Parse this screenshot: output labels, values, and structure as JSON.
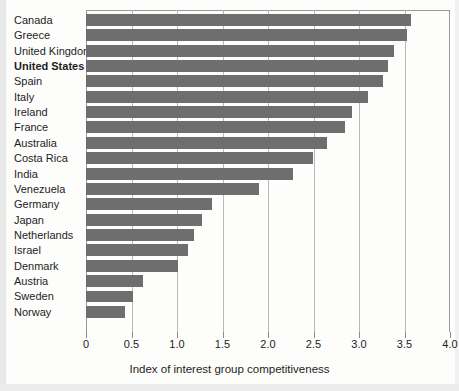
{
  "chart_data": {
    "type": "bar",
    "orientation": "horizontal",
    "title": "",
    "xlabel": "Index of interest group competitiveness",
    "ylabel": "",
    "xlim": [
      0,
      4.0
    ],
    "xticks": [
      "0",
      "0.5",
      "1.0",
      "1.5",
      "2.0",
      "2.5",
      "3.0",
      "3.5",
      "4.0"
    ],
    "xtick_values": [
      0,
      0.5,
      1.0,
      1.5,
      2.0,
      2.5,
      3.0,
      3.5,
      4.0
    ],
    "grid": true,
    "grid_axis": "x",
    "legend": "none",
    "bar_color": "#6e6e6e",
    "highlight_category": "United States",
    "categories": [
      "Canada",
      "Greece",
      "United Kingdom",
      "United States",
      "Spain",
      "Italy",
      "Ireland",
      "France",
      "Australia",
      "Costa Rica",
      "India",
      "Venezuela",
      "Germany",
      "Japan",
      "Netherlands",
      "Israel",
      "Denmark",
      "Austria",
      "Sweden",
      "Norway"
    ],
    "values": [
      3.57,
      3.53,
      3.38,
      3.32,
      3.26,
      3.1,
      2.92,
      2.85,
      2.65,
      2.49,
      2.27,
      1.9,
      1.38,
      1.27,
      1.19,
      1.12,
      1.01,
      0.63,
      0.52,
      0.43
    ]
  }
}
